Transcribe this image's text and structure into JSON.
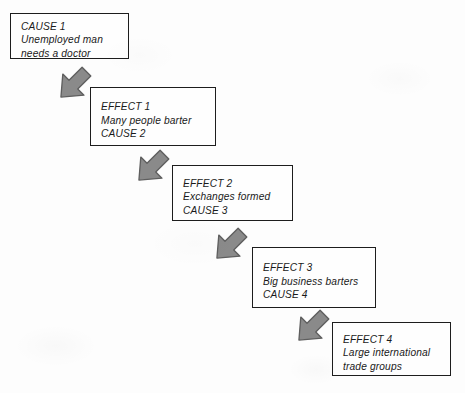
{
  "diagram": {
    "type": "cause-and-effect-chain",
    "background_color": "#fdfdfd",
    "box_border_color": "#1d1d1d",
    "arrow_fill_color": "#8a8a8a",
    "arrow_edge_color": "#5e5e5e",
    "text_color": "#1a1a1a",
    "nodes": [
      {
        "id": "node-1",
        "lines": [
          "CAUSE 1",
          "Unemployed man",
          "needs a doctor"
        ],
        "x": 10,
        "y": 13,
        "width": 119,
        "height": 46
      },
      {
        "id": "node-2",
        "lines": [
          "EFFECT 1",
          "Many people barter",
          "CAUSE 2"
        ],
        "x": 90,
        "y": 87,
        "width": 126,
        "height": 59
      },
      {
        "id": "node-3",
        "lines": [
          "EFFECT 2",
          "Exchanges formed",
          "CAUSE 3"
        ],
        "x": 172,
        "y": 165,
        "width": 121,
        "height": 56
      },
      {
        "id": "node-4",
        "lines": [
          "EFFECT 3",
          "Big business barters",
          "CAUSE 4"
        ],
        "x": 252,
        "y": 247,
        "width": 124,
        "height": 61
      },
      {
        "id": "node-5",
        "lines": [
          "EFFECT 4",
          "Large international",
          "trade groups"
        ],
        "x": 332,
        "y": 322,
        "width": 119,
        "height": 54
      }
    ],
    "arrows": [
      {
        "id": "arrow-1",
        "from": "node-1",
        "to": "node-2",
        "x": 52,
        "y": 62,
        "size": 44,
        "rotation": 45
      },
      {
        "id": "arrow-2",
        "from": "node-2",
        "to": "node-3",
        "x": 130,
        "y": 145,
        "size": 44,
        "rotation": 45
      },
      {
        "id": "arrow-3",
        "from": "node-3",
        "to": "node-4",
        "x": 208,
        "y": 223,
        "size": 44,
        "rotation": 45
      },
      {
        "id": "arrow-4",
        "from": "node-4",
        "to": "node-5",
        "x": 290,
        "y": 305,
        "size": 44,
        "rotation": 45
      }
    ]
  }
}
